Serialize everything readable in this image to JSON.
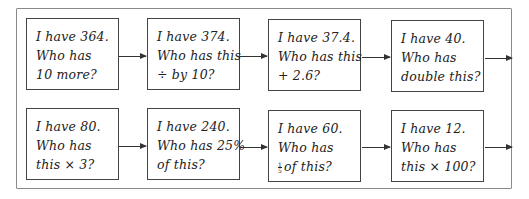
{
  "diagram": {
    "type": "loop-card-chain",
    "rows": [
      {
        "cards": [
          {
            "lines": [
              "I have 364.",
              "Who has",
              "10 more?"
            ]
          },
          {
            "lines": [
              "I have 374.",
              "Who has this",
              "÷ by 10?"
            ]
          },
          {
            "lines": [
              "I have 37.4.",
              "Who has this",
              "+ 2.6?"
            ]
          },
          {
            "lines": [
              "I have 40.",
              "Who has",
              "double this?"
            ]
          }
        ]
      },
      {
        "cards": [
          {
            "lines": [
              "I have 80.",
              "Who has",
              "this × 3?"
            ]
          },
          {
            "lines": [
              "I have 240.",
              "Who has 25%",
              "of this?"
            ]
          },
          {
            "lines": [
              "I have 60.",
              "Who has",
              "of this?"
            ],
            "fraction": {
              "numerator": "1",
              "denominator": "5"
            }
          },
          {
            "lines": [
              "I have 12.",
              "Who has",
              "this × 100?"
            ]
          }
        ]
      }
    ],
    "colors": {
      "card_border": "#444444",
      "frame_border": "#8a8a8a",
      "arrow": "#333333",
      "text": "#222222"
    }
  }
}
